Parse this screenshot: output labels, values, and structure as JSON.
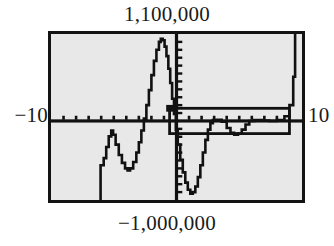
{
  "figure": {
    "kind": "graphing-calculator-screen"
  },
  "labels": {
    "y_max": "1,100,000",
    "y_min": "−1,000,000",
    "x_min": "−10",
    "x_max": "10"
  },
  "colors": {
    "ink": "#131313",
    "screen_background": "#e8e8e8",
    "page_background": "#ffffff",
    "curve": "#111111"
  },
  "chart_data": {
    "type": "line",
    "title": "",
    "xlabel": "",
    "ylabel": "",
    "xlim": [
      -10,
      10
    ],
    "ylim": [
      -1000000,
      1100000
    ],
    "grid": false,
    "legend": null,
    "x_ticks": [
      -9,
      -8,
      -7,
      -6,
      -5,
      -4,
      -3,
      -2,
      -1,
      1,
      2,
      3,
      4,
      5,
      6,
      7,
      8,
      9
    ],
    "y_ticks": [
      -900000,
      -800000,
      -700000,
      -600000,
      -500000,
      -400000,
      -300000,
      -200000,
      -100000,
      100000,
      200000,
      300000,
      400000,
      500000,
      600000,
      700000,
      800000,
      900000,
      1000000
    ],
    "x_tick_labels": [
      "−10",
      "10"
    ],
    "y_tick_labels": [
      "−1,000,000",
      "1,100,000"
    ],
    "series": [
      {
        "name": "curve",
        "points": [
          [
            -6.05,
            -1000000
          ],
          [
            -6.05,
            -560000
          ],
          [
            -5.8,
            -470000
          ],
          [
            -5.6,
            -330000
          ],
          [
            -5.4,
            -195000
          ],
          [
            -5.2,
            -120000
          ],
          [
            -5.05,
            -175000
          ],
          [
            -4.85,
            -300000
          ],
          [
            -4.6,
            -430000
          ],
          [
            -4.35,
            -530000
          ],
          [
            -4.1,
            -600000
          ],
          [
            -3.9,
            -625000
          ],
          [
            -3.7,
            -600000
          ],
          [
            -3.45,
            -520000
          ],
          [
            -3.2,
            -400000
          ],
          [
            -3.0,
            -270000
          ],
          [
            -2.8,
            -120000
          ],
          [
            -2.6,
            30000
          ],
          [
            -2.4,
            200000
          ],
          [
            -2.2,
            390000
          ],
          [
            -2.0,
            580000
          ],
          [
            -1.8,
            760000
          ],
          [
            -1.6,
            900000
          ],
          [
            -1.4,
            1000000
          ],
          [
            -1.25,
            1040000
          ],
          [
            -1.1,
            1020000
          ],
          [
            -0.95,
            940000
          ],
          [
            -0.8,
            820000
          ],
          [
            -0.65,
            660000
          ],
          [
            -0.5,
            480000
          ],
          [
            -0.35,
            280000
          ],
          [
            -0.2,
            90000
          ],
          [
            -0.05,
            -110000
          ],
          [
            0.1,
            -300000
          ],
          [
            0.3,
            -490000
          ],
          [
            0.5,
            -650000
          ],
          [
            0.7,
            -780000
          ],
          [
            0.9,
            -870000
          ],
          [
            1.1,
            -920000
          ],
          [
            1.3,
            -900000
          ],
          [
            1.5,
            -830000
          ],
          [
            1.7,
            -710000
          ],
          [
            1.9,
            -560000
          ],
          [
            2.1,
            -400000
          ],
          [
            2.3,
            -240000
          ],
          [
            2.5,
            -110000
          ],
          [
            2.7,
            -30000
          ],
          [
            2.9,
            10000
          ],
          [
            3.2,
            15000
          ],
          [
            3.6,
            -10000
          ],
          [
            4.0,
            -90000
          ],
          [
            4.3,
            -150000
          ],
          [
            4.6,
            -175000
          ],
          [
            4.9,
            -160000
          ],
          [
            5.2,
            -110000
          ],
          [
            5.5,
            -45000
          ],
          [
            5.8,
            0
          ],
          [
            6.2,
            10000
          ],
          [
            6.8,
            5000
          ],
          [
            7.4,
            0
          ],
          [
            8.0,
            10000
          ],
          [
            8.6,
            60000
          ],
          [
            9.0,
            200000
          ],
          [
            9.3,
            560000
          ],
          [
            9.45,
            1100000
          ]
        ]
      }
    ],
    "annotations": [
      {
        "name": "zoom-box",
        "type": "rectangle",
        "x0": -0.55,
        "x1": 9.0,
        "y0": -160000,
        "y1": 160000,
        "filled": false
      },
      {
        "name": "zoom-box-corner-marker",
        "type": "square-marker",
        "x": -0.55,
        "y": 160000
      }
    ]
  }
}
